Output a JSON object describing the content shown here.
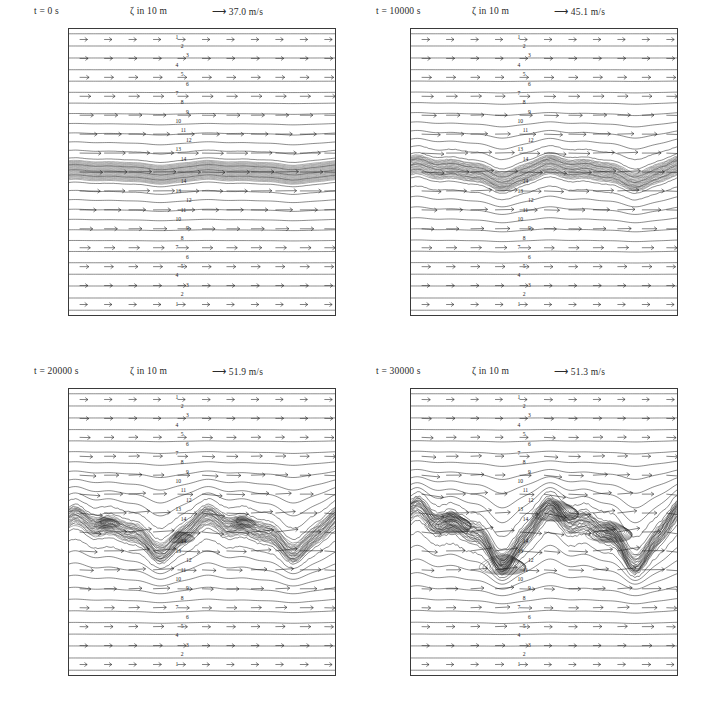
{
  "figure": {
    "width": 703,
    "height": 726,
    "background": "#ffffff",
    "line_color": "#1c1c1c",
    "panel_count": 4
  },
  "common": {
    "zeta_label": "ζ",
    "zeta_units": "in 10 m",
    "arrow_glyph": "⟶",
    "time_prefix": "t =",
    "time_units": "s",
    "speed_units": "m/s",
    "x_axis_name": "x",
    "x_axis_unit": "km",
    "y_axis_name": "y",
    "y_axis_unit": "km",
    "x_ticks": [
      500,
      1000,
      1500,
      2000,
      2500
    ],
    "y_ticks": [
      500,
      1000,
      1500,
      2000,
      2500
    ],
    "x_range": [
      0,
      3000
    ],
    "y_range": [
      0,
      3000
    ],
    "contour_levels": [
      1,
      2,
      3,
      4,
      5,
      6,
      7,
      8,
      9,
      10,
      11,
      12,
      13,
      14
    ]
  },
  "panels": [
    {
      "id": "panel-t0",
      "time": "0",
      "time_text": "t =     0 s",
      "zeta_text": "ζ  in 10 m",
      "vector_text": "⟶ 37.0 m/s",
      "max_speed": 37.0,
      "jet_center_km": 1500,
      "stage": "initial unperturbed jet"
    },
    {
      "id": "panel-t10000",
      "time": "10000",
      "time_text": "t = 10000 s",
      "zeta_text": "ζ  in 10 m",
      "vector_text": "⟶ 45.1 m/s",
      "max_speed": 45.1,
      "jet_center_km": 1500,
      "stage": "early wave growth"
    },
    {
      "id": "panel-t20000",
      "time": "20000",
      "time_text": "t = 20000 s",
      "zeta_text": "ζ  in 10 m",
      "vector_text": "⟶ 51.9 m/s",
      "max_speed": 51.9,
      "jet_center_km": 1500,
      "stage": "nonlinear wave steepening"
    },
    {
      "id": "panel-t30000",
      "time": "30000",
      "time_text": "t = 30000 s",
      "zeta_text": "ζ  in 10 m",
      "vector_text": "⟶ 51.3 m/s",
      "max_speed": 51.3,
      "jet_center_km": 1500,
      "stage": "vortex roll-up"
    }
  ],
  "chart_data": {
    "type": "line",
    "xlabel": "x  km",
    "ylabel": "y  km",
    "xlim": [
      0,
      3000
    ],
    "ylim": [
      0,
      3000
    ],
    "grid": false,
    "legend": "none",
    "series": [
      {
        "name": "t = 0 s",
        "max_wind_speed": 37.0,
        "contour_levels": [
          1,
          2,
          3,
          4,
          5,
          6,
          7,
          8,
          9,
          10,
          11,
          12,
          13,
          14
        ],
        "jet_axis_y_km": 1500,
        "perturbation_amplitude_km": 20
      },
      {
        "name": "t = 10000 s",
        "max_wind_speed": 45.1,
        "contour_levels": [
          1,
          2,
          3,
          4,
          5,
          6,
          7,
          8,
          9,
          10,
          11,
          12,
          13,
          14
        ],
        "jet_axis_y_km": 1500,
        "perturbation_amplitude_km": 70
      },
      {
        "name": "t = 20000 s",
        "max_wind_speed": 51.9,
        "contour_levels": [
          1,
          2,
          3,
          4,
          5,
          6,
          7,
          8,
          9,
          10,
          11,
          12,
          13,
          14
        ],
        "jet_axis_y_km": 1500,
        "perturbation_amplitude_km": 150
      },
      {
        "name": "t = 30000 s",
        "max_wind_speed": 51.3,
        "contour_levels": [
          1,
          2,
          3,
          4,
          5,
          6,
          7,
          8,
          9,
          10,
          11,
          12,
          13,
          14
        ],
        "jet_axis_y_km": 1500,
        "perturbation_amplitude_km": 230
      }
    ]
  }
}
